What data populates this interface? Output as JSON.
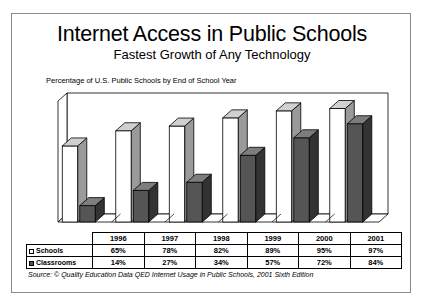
{
  "card": {
    "title": "Internet Access in Public Schools",
    "subtitle": "Fastest Growth of Any Technology",
    "axis_note": "Percentage of U.S. Public Schools by End of School Year",
    "source": "Source: © Quality Education Data QED Internet Usage in Public Schools, 2001 Sixth Edition",
    "border_color": "#8a8a8a"
  },
  "legend": {
    "schools_label": "Schools",
    "classrooms_label": "Classrooms",
    "schools_swatch": "light-square-swatch",
    "classrooms_swatch": "dark-square-swatch"
  },
  "table": {
    "corner_label": "",
    "columns": [
      "1996",
      "1997",
      "1998",
      "1999",
      "2000",
      "2001"
    ],
    "rows": [
      {
        "label": "Schools",
        "values": [
          "65%",
          "78%",
          "82%",
          "89%",
          "95%",
          "97%"
        ]
      },
      {
        "label": "Classrooms",
        "values": [
          "14%",
          "27%",
          "34%",
          "57%",
          "72%",
          "84%"
        ]
      }
    ]
  },
  "chart_data": {
    "type": "bar",
    "title": "Internet Access in Public Schools",
    "subtitle": "Fastest Growth of Any Technology",
    "xlabel": "",
    "ylabel": "Percentage of U.S. Public Schools by End of School Year",
    "categories": [
      "1996",
      "1997",
      "1998",
      "1999",
      "2000",
      "2001"
    ],
    "series": [
      {
        "name": "Schools",
        "values": [
          65,
          78,
          82,
          89,
          95,
          97
        ],
        "color": "#ffffff",
        "side_color": "#9a9a9a",
        "top_color": "#d0d0d0"
      },
      {
        "name": "Classrooms",
        "values": [
          14,
          27,
          34,
          57,
          72,
          84
        ],
        "color": "#555555",
        "side_color": "#333333",
        "top_color": "#7d7d7d"
      }
    ],
    "ylim": [
      0,
      100
    ],
    "grid": false,
    "legend_position": "table-row-labels",
    "style": "3d-column",
    "units": "percent"
  }
}
